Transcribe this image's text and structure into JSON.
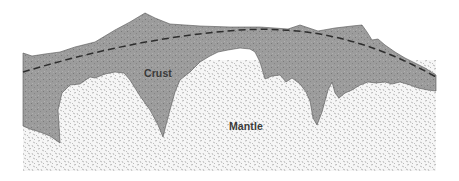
{
  "diagram": {
    "type": "geologic-cross-section",
    "labels": {
      "crust": "Crust",
      "mantle": "Mantle"
    },
    "layers": [
      {
        "name": "Crust",
        "pattern": "fine-stipple",
        "fill": "#9a9a9a"
      },
      {
        "name": "Mantle",
        "pattern": "dash-stipple",
        "fill": "#f4f4f4"
      }
    ],
    "boundary_line": {
      "style": "dashed",
      "color": "#2e2e2e"
    },
    "colors": {
      "crust": "#9c9c9c",
      "mantle": "#f5f5f5",
      "stipple": "#6f6f6f",
      "outline": "#555555",
      "dash": "#2e2e2e"
    }
  }
}
